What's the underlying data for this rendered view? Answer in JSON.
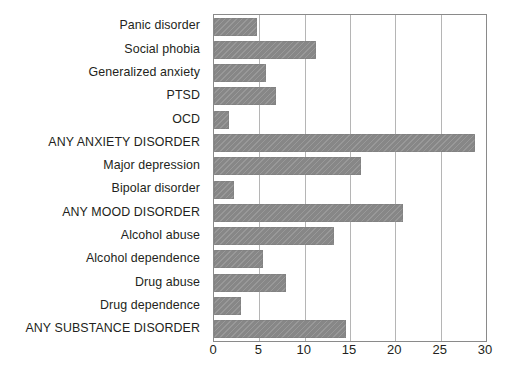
{
  "chart_data": {
    "type": "bar",
    "orientation": "horizontal",
    "title": "",
    "subtitle": "",
    "xlabel": "",
    "ylabel": "",
    "xlim": [
      0,
      30
    ],
    "xticks": [
      0,
      5,
      10,
      15,
      20,
      25,
      30
    ],
    "xtick_labels": [
      "0",
      "5",
      "10",
      "15",
      "20",
      "25",
      "30"
    ],
    "grid": true,
    "legend": false,
    "legend_position": "none",
    "bar_color": "#8d8d8d",
    "grid_color": "#b5b5b5",
    "axis_color": "#8a8a8a",
    "text_color": "#231f20",
    "categories": [
      "Panic disorder",
      "Social phobia",
      "Generalized anxiety",
      "PTSD",
      "OCD",
      "ANY ANXIETY DISORDER",
      "Major depression",
      "Bipolar disorder",
      "ANY MOOD DISORDER",
      "Alcohol abuse",
      "Alcohol dependence",
      "Drug abuse",
      "Drug dependence",
      "ANY SUBSTANCE DISORDER"
    ],
    "values": [
      4.7,
      11.3,
      5.7,
      6.8,
      1.6,
      28.8,
      16.2,
      2.2,
      20.8,
      13.2,
      5.4,
      7.9,
      3.0,
      14.6
    ]
  }
}
